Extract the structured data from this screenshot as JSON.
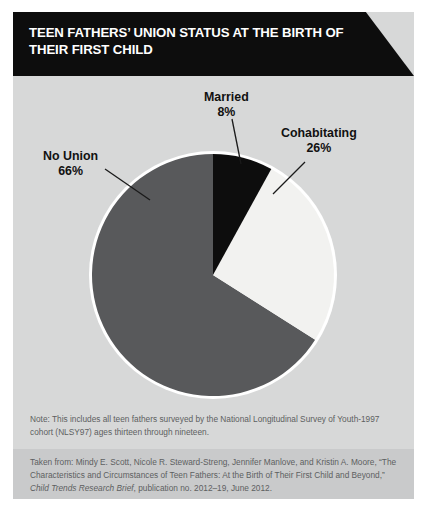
{
  "figure": {
    "title": "TEEN FATHERS’ UNION STATUS AT THE BIRTH OF THEIR FIRST CHILD",
    "note": "Note: This includes all teen fathers surveyed by the National Longitudinal Survey of Youth-1997 cohort (NLSY97) ages thirteen through nineteen.",
    "source_prefix": "Taken from: Mindy E. Scott, Nicole R. Steward-Streng, Jennifer Manlove, and Kristin A. Moore, “The Characteristics and Circumstances of Teen Fathers: At the Birth of Their First Child and Beyond,” ",
    "source_italic": "Child Trends Research Brief",
    "source_suffix": ", publication no. 2012–19, June 2012."
  },
  "labels": {
    "married": {
      "name": "Married",
      "pct": "8%"
    },
    "cohabiting": {
      "name": "Cohabitating",
      "pct": "26%"
    },
    "nounion": {
      "name": "No Union",
      "pct": "66%"
    }
  },
  "colors": {
    "background": "#d7d8d8",
    "source_background": "#c9cacb",
    "banner": "#0d0d0d",
    "married": "#0d0d0d",
    "cohabiting": "#f2f2f0",
    "nounion": "#58595b",
    "pie_outline": "#ffffff",
    "leader_line": "#1a1a1a",
    "note_text": "#5d5f61"
  },
  "chart_data": {
    "type": "pie",
    "title": "TEEN FATHERS’ UNION STATUS AT THE BIRTH OF THEIR FIRST CHILD",
    "xlabel": "",
    "ylabel": "",
    "legend_position": "callout-labels",
    "grid": false,
    "start_angle_deg": 0,
    "direction": "clockwise",
    "units": "percent",
    "categories": [
      "Married",
      "Cohabitating",
      "No Union"
    ],
    "values": [
      8,
      26,
      66
    ],
    "slices": [
      {
        "label": "Married",
        "value": 8,
        "display": "8%",
        "color": "#0d0d0d",
        "start_deg": 0,
        "end_deg": 28.8
      },
      {
        "label": "Cohabitating",
        "value": 26,
        "display": "26%",
        "color": "#f2f2f0",
        "start_deg": 28.8,
        "end_deg": 122.4
      },
      {
        "label": "No Union",
        "value": 66,
        "display": "66%",
        "color": "#58595b",
        "start_deg": 122.4,
        "end_deg": 360
      }
    ]
  }
}
